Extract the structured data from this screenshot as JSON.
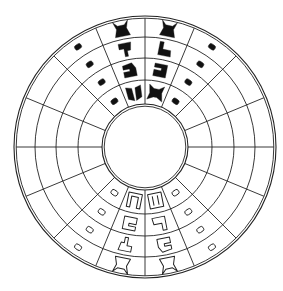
{
  "diagram": {
    "type": "circular-wheel",
    "center": [
      145,
      147
    ],
    "outer_radius": 131,
    "outer_gap": 2.2,
    "inner_radius": 43,
    "inner_gap": 2.2,
    "ring_radii": [
      67,
      89,
      110
    ],
    "sectors": 16,
    "sector_angle_deg": 22.5,
    "line_color": "#222222",
    "fill_color": "#111111",
    "background": "#ffffff",
    "glyph_rings": [
      {
        "r_mid": 55,
        "size": 17
      },
      {
        "r_mid": 78,
        "size": 16
      },
      {
        "r_mid": 99.5,
        "size": 16
      },
      {
        "r_mid": 120.5,
        "size": 17
      }
    ],
    "upper_half": {
      "style": "filled",
      "columns": [
        {
          "angle_deg": 78.75,
          "kind": "glyph",
          "glyphs": [
            "crossed-beast",
            "hook-block",
            "foot-shape",
            "horned-block"
          ]
        },
        {
          "angle_deg": 101.25,
          "kind": "glyph",
          "glyphs": [
            "split-crab",
            "notched-square",
            "boot-shape",
            "horned-block"
          ]
        },
        {
          "angle_deg": 56.25,
          "kind": "blob"
        },
        {
          "angle_deg": 123.75,
          "kind": "blob"
        }
      ]
    },
    "lower_half": {
      "style": "outlined",
      "columns": [
        {
          "angle_deg": 258.75,
          "kind": "glyph",
          "glyphs": [
            "u-bracket",
            "hook-block",
            "boot-shape",
            "horned-block"
          ]
        },
        {
          "angle_deg": 281.25,
          "kind": "glyph",
          "glyphs": [
            "double-bar",
            "foot-shape",
            "notched-square",
            "horned-block"
          ]
        },
        {
          "angle_deg": 236.25,
          "kind": "blob"
        },
        {
          "angle_deg": 303.75,
          "kind": "blob"
        }
      ]
    }
  }
}
